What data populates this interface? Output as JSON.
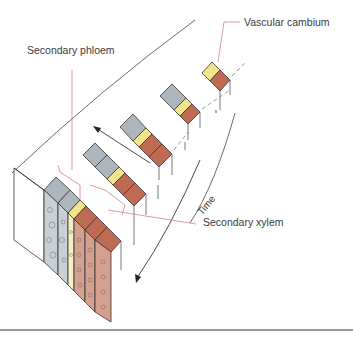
{
  "labels": {
    "vascular_cambium": "Vascular cambium",
    "secondary_phloem": "Secondary phloem",
    "secondary_xylem": "Secondary xylem",
    "time": "Time"
  },
  "colors": {
    "phloem": "#aeb6bd",
    "phloem_light": "#c9d0d5",
    "cambium": "#f2e48a",
    "xylem": "#bf6a52",
    "xylem_light": "#d6a08e",
    "leader": "#d26b86",
    "outline": "#333333"
  }
}
